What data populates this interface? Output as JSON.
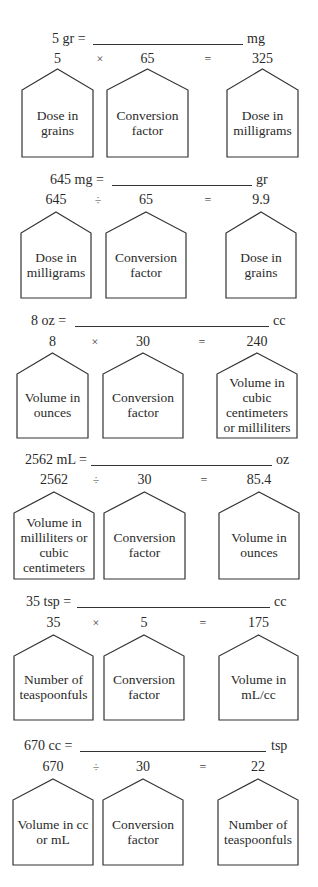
{
  "problems": [
    {
      "equation_left": "5 gr =",
      "equation_unit": "mg",
      "operand1": "5",
      "operator": "×",
      "operand2": "65",
      "equals": "=",
      "result": "325",
      "boxes": [
        "Dose in grains",
        "Conversion factor",
        "Dose in milligrams"
      ]
    },
    {
      "equation_left": "645 mg =",
      "equation_unit": "gr",
      "operand1": "645",
      "operator": "÷",
      "operand2": "65",
      "equals": "=",
      "result": "9.9",
      "boxes": [
        "Dose in milligrams",
        "Conversion factor",
        "Dose in grains"
      ]
    },
    {
      "equation_left": "8 oz =",
      "equation_unit": "cc",
      "operand1": "8",
      "operator": "×",
      "operand2": "30",
      "equals": "=",
      "result": "240",
      "boxes": [
        "Volume in ounces",
        "Conversion factor",
        "Volume in cubic centimeters or milliliters"
      ]
    },
    {
      "equation_left": "2562 mL =",
      "equation_unit": "oz",
      "operand1": "2562",
      "operator": "÷",
      "operand2": "30",
      "equals": "=",
      "result": "85.4",
      "boxes": [
        "Volume in milliliters or cubic centimeters",
        "Conversion factor",
        "Volume in ounces"
      ]
    },
    {
      "equation_left": "35 tsp =",
      "equation_unit": "cc",
      "operand1": "35",
      "operator": "×",
      "operand2": "5",
      "equals": "=",
      "result": "175",
      "boxes": [
        "Number of teaspoonfuls",
        "Conversion factor",
        "Volume in mL/cc"
      ]
    },
    {
      "equation_left": "670 cc =",
      "equation_unit": "tsp",
      "operand1": "670",
      "operator": "÷",
      "operand2": "30",
      "equals": "=",
      "result": "22",
      "boxes": [
        "Volume in cc or mL",
        "Conversion factor",
        "Number of teaspoonfuls"
      ]
    }
  ]
}
